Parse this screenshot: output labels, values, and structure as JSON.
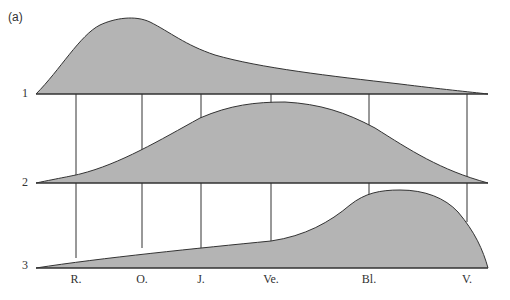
{
  "panel_label": "(a)",
  "rows": [
    {
      "label": "1",
      "baseline_y": 94
    },
    {
      "label": "2",
      "baseline_y": 183
    },
    {
      "label": "3",
      "baseline_y": 268
    }
  ],
  "columns": [
    {
      "label": "R.",
      "x": 76
    },
    {
      "label": "O.",
      "x": 142
    },
    {
      "label": "J.",
      "x": 201
    },
    {
      "label": "Ve.",
      "x": 271
    },
    {
      "label": "Bl.",
      "x": 369
    },
    {
      "label": "V.",
      "x": 467
    }
  ],
  "colors": {
    "fill": "#b4b4b4",
    "stroke": "#333333",
    "background": "#ffffff"
  }
}
